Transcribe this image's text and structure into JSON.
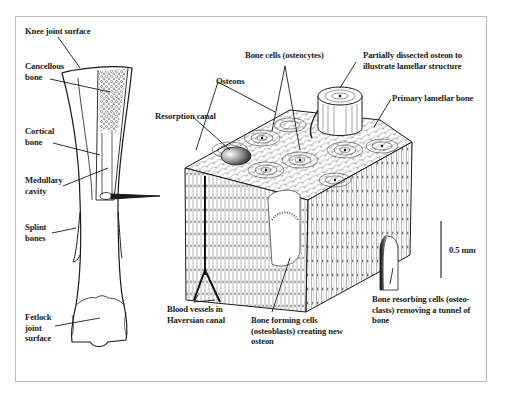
{
  "figure": {
    "frame_color": "#b9b9b9",
    "ink_color": "#1a1a1a",
    "left_panel": {
      "title": "Horse metacarpal (cannon) bone, longitudinal section",
      "labels": {
        "knee_joint_surface": "Knee joint surface",
        "cancellous_bone": "Cancellous\nbone",
        "cortical_bone": "Cortical\nbone",
        "medullary_cavity": "Medullary\ncavity",
        "splint_bones": "Splint\nbones",
        "fetlock_joint_surface": "Fetlock\njoint\nsurface"
      }
    },
    "right_panel": {
      "title": "Enlarged block of cortical bone",
      "labels": {
        "bone_cells": "Bone cells (osteocytes)",
        "dissected_osteon": "Partially dissected osteon to\nillustrate lamellar structure",
        "osteons": "Osteons",
        "resorption_canal": "Resorption canal",
        "primary_lamellar_bone": "Primary lamellar bone",
        "blood_vessels": "Blood vessels in\nHaversian canal",
        "osteoblasts": "Bone forming cells\n(osteoblasts) creating new\nosteon",
        "osteoclasts": "Bone resorbing cells (osteo-\nclasts) removing a tunnel of\nbone"
      },
      "scale_bar": {
        "label": "0.5 mm"
      }
    }
  }
}
